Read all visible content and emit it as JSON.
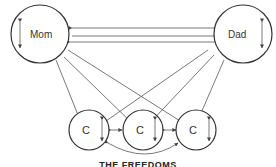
{
  "diagram": {
    "nodes": {
      "mom": {
        "label": "Mom"
      },
      "dad": {
        "label": "Dad"
      },
      "child1": {
        "label": "C"
      },
      "child2": {
        "label": "C"
      },
      "child3": {
        "label": "C"
      }
    },
    "caption": "THE FREEDOMS",
    "colors": {
      "stroke": "#333333",
      "background": "#ffffff"
    }
  }
}
